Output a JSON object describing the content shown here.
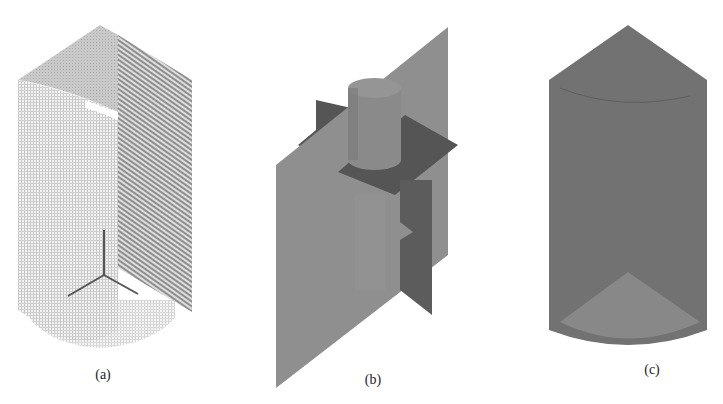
{
  "figure": {
    "panels": [
      {
        "id": "a",
        "label": "(a)",
        "description": "Mesh grid of cylindrical vessel quarter section with baffle plane and three-arm impeller axis"
      },
      {
        "id": "b",
        "label": "(b)",
        "description": "Internal components: cylindrical shaft hub, vertical plane, horizontal and vertical baffle plates"
      },
      {
        "id": "c",
        "label": "(c)",
        "description": "Solid rendered cylindrical vessel domain"
      }
    ],
    "colors": {
      "background": "#ffffff",
      "mesh_light": "#d4d4d4",
      "mesh_dark": "#9a9a9a",
      "plane_gray": "#8f8f8f",
      "plate_dark": "#555555",
      "solid_gray": "#707070",
      "solid_light": "#858585"
    }
  }
}
